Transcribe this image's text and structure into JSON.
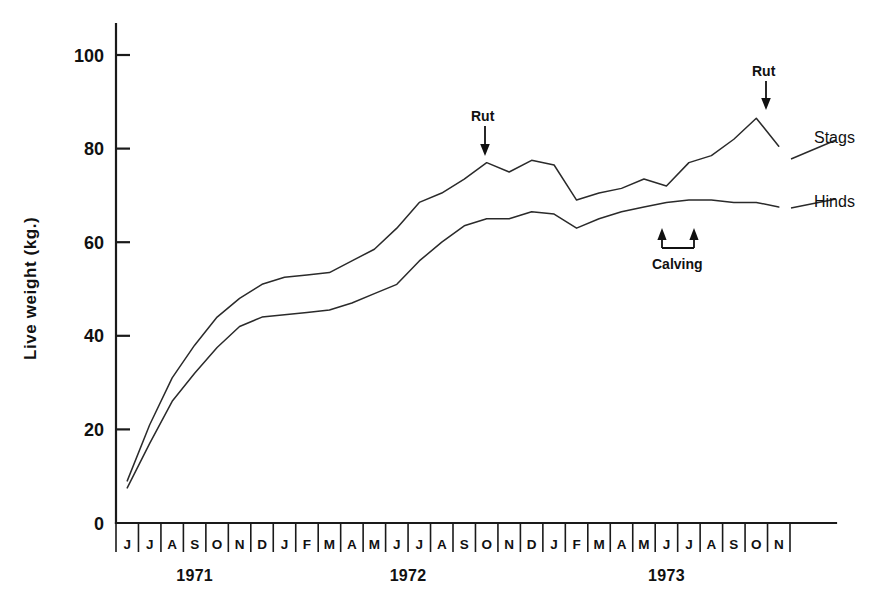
{
  "figure": {
    "ylabel": "Live  weight  (kg.)",
    "y_ticks": [
      "0",
      "20",
      "40",
      "60",
      "80",
      "100"
    ],
    "year_labels": [
      "1971",
      "1972",
      "1973"
    ],
    "series_labels": {
      "stags": "Stags",
      "hinds": "Hinds"
    },
    "annotations": {
      "rut1": "Rut",
      "rut2": "Rut",
      "calving": "Calving"
    },
    "colors": {
      "line": "#2a2a2a",
      "axis": "#1a1a1a",
      "background": "#ffffff"
    }
  },
  "chart_data": {
    "type": "line",
    "title": "",
    "xlabel": "",
    "ylabel": "Live weight (kg.)",
    "ylim": [
      0,
      105
    ],
    "grid": false,
    "legend": "inline-right",
    "x_tick_labels": [
      "J",
      "J",
      "A",
      "S",
      "O",
      "N",
      "D",
      "J",
      "F",
      "M",
      "A",
      "M",
      "J",
      "J",
      "A",
      "S",
      "O",
      "N",
      "D",
      "J",
      "F",
      "M",
      "A",
      "M",
      "J",
      "J",
      "A",
      "S",
      "O",
      "N"
    ],
    "x_months": [
      "1971-06",
      "1971-07",
      "1971-08",
      "1971-09",
      "1971-10",
      "1971-11",
      "1971-12",
      "1972-01",
      "1972-02",
      "1972-03",
      "1972-04",
      "1972-05",
      "1972-06",
      "1972-07",
      "1972-08",
      "1972-09",
      "1972-10",
      "1972-11",
      "1972-12",
      "1973-01",
      "1973-02",
      "1973-03",
      "1973-04",
      "1973-05",
      "1973-06",
      "1973-07",
      "1973-08",
      "1973-09",
      "1973-10",
      "1973-11"
    ],
    "year_groups": [
      {
        "label": "1971",
        "start_index": 0,
        "end_index": 6
      },
      {
        "label": "1972",
        "start_index": 7,
        "end_index": 18
      },
      {
        "label": "1973",
        "start_index": 19,
        "end_index": 29
      }
    ],
    "series": [
      {
        "name": "Stags",
        "values": [
          9,
          21,
          31,
          38,
          44,
          48,
          51,
          52.5,
          53,
          53.5,
          56,
          58.5,
          63,
          68.5,
          70.5,
          73.5,
          77,
          75,
          77.5,
          76.5,
          69,
          70.5,
          71.5,
          73.5,
          72,
          77,
          78.5,
          82,
          86.5,
          80.5
        ]
      },
      {
        "name": "Hinds",
        "values": [
          7.5,
          17,
          26,
          32,
          37.5,
          42,
          44,
          44.5,
          45,
          45.5,
          47,
          49,
          51,
          56,
          60,
          63.5,
          65,
          65,
          66.5,
          66,
          63,
          65,
          66.5,
          67.5,
          68.5,
          69,
          69,
          68.5,
          68.5,
          67.5
        ]
      }
    ],
    "events": [
      {
        "label": "Rut",
        "month": "1972-10",
        "type": "down-arrow"
      },
      {
        "label": "Rut",
        "month": "1973-10",
        "type": "down-arrow"
      },
      {
        "label": "Calving",
        "from_month": "1973-05",
        "to_month": "1973-06",
        "type": "bracket-up-arrows"
      }
    ]
  }
}
